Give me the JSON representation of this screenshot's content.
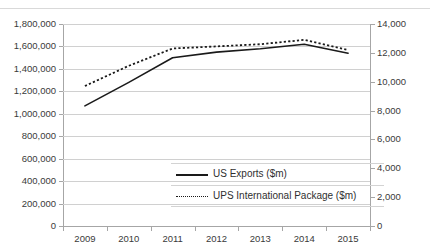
{
  "title": {
    "text": "",
    "cut_off": true
  },
  "chart_data": {
    "type": "line",
    "title": "",
    "xlabel": "",
    "ylabel": "",
    "grid": true,
    "legend_position": "inside-lower-center",
    "categories": [
      "2009",
      "2010",
      "2011",
      "2012",
      "2013",
      "2014",
      "2015"
    ],
    "x_tick_labels": [
      "2009",
      "2010",
      "2011",
      "2012",
      "2013",
      "2014",
      "2015"
    ],
    "left_axis": {
      "ylim": [
        0,
        1800000
      ],
      "ticks": [
        0,
        200000,
        400000,
        600000,
        800000,
        1000000,
        1200000,
        1400000,
        1600000,
        1800000
      ],
      "tick_labels": [
        "0",
        "200,000",
        "400,000",
        "600,000",
        "800,000",
        "1,000,000",
        "1,200,000",
        "1,400,000",
        "1,600,000",
        "1,800,000"
      ]
    },
    "right_axis": {
      "ylim": [
        0,
        14000
      ],
      "ticks": [
        0,
        2000,
        4000,
        6000,
        8000,
        10000,
        12000,
        14000
      ],
      "tick_labels": [
        "0",
        "2,000",
        "4,000",
        "6,000",
        "8,000",
        "10,000",
        "12,000",
        "14,000"
      ]
    },
    "series": [
      {
        "name": "US Exports ($m)",
        "axis": "left",
        "style": "solid",
        "color": "#1a1a1a",
        "values": [
          1070000,
          1280000,
          1500000,
          1550000,
          1580000,
          1620000,
          1540000
        ]
      },
      {
        "name": "UPS International Package ($m)",
        "axis": "right",
        "style": "dotted",
        "color": "#1a1a1a",
        "values": [
          9700,
          11100,
          12300,
          12450,
          12600,
          12900,
          12200
        ]
      }
    ]
  },
  "legend": {
    "items": [
      {
        "label": "US Exports ($m)",
        "style": "solid"
      },
      {
        "label": "UPS International Package ($m)",
        "style": "dotted"
      }
    ]
  }
}
